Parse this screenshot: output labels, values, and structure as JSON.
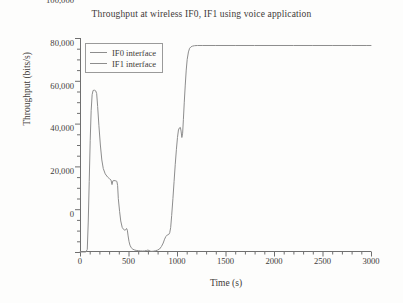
{
  "chart_data": {
    "type": "line",
    "title": "Throughput at wireless IF0, IF1 using voice application",
    "xlabel": "Time (s)",
    "ylabel": "Throughput (bits/s)",
    "xlim": [
      0,
      3000
    ],
    "ylim": [
      0,
      100000
    ],
    "grid": false,
    "legend_position": "upper left",
    "xticks": [
      0,
      500,
      1000,
      1500,
      2000,
      2500,
      3000
    ],
    "xtick_labels": [
      "0",
      "500",
      "1000",
      "1500",
      "2000",
      "2500",
      "3000"
    ],
    "xminor_interval": 100,
    "yticks": [
      0,
      20000,
      40000,
      60000,
      80000,
      100000
    ],
    "ytick_labels": [
      "0",
      "20,000",
      "40,000",
      "60,000",
      "80,000",
      "100,000"
    ],
    "yminor_interval": 5000,
    "line_color": "#8d8d8d",
    "series": [
      {
        "name": "IF0 interface",
        "points": [
          [
            0,
            0
          ],
          [
            40,
            0
          ],
          [
            60,
            0
          ],
          [
            75,
            1200
          ],
          [
            85,
            14000
          ],
          [
            95,
            33000
          ],
          [
            105,
            52000
          ],
          [
            115,
            66000
          ],
          [
            125,
            73500
          ],
          [
            135,
            75500
          ],
          [
            150,
            75600
          ],
          [
            162,
            75300
          ],
          [
            172,
            74000
          ],
          [
            182,
            68000
          ],
          [
            195,
            59000
          ],
          [
            210,
            50000
          ],
          [
            225,
            43000
          ],
          [
            240,
            39000
          ],
          [
            260,
            36500
          ],
          [
            285,
            35000
          ],
          [
            305,
            34200
          ],
          [
            320,
            33600
          ],
          [
            330,
            31500
          ],
          [
            338,
            33200
          ],
          [
            350,
            33400
          ],
          [
            362,
            33300
          ],
          [
            372,
            33200
          ],
          [
            380,
            33000
          ],
          [
            388,
            31000
          ],
          [
            395,
            25000
          ],
          [
            408,
            19000
          ],
          [
            420,
            14500
          ],
          [
            435,
            11500
          ],
          [
            450,
            10500
          ],
          [
            462,
            10200
          ],
          [
            472,
            10400
          ],
          [
            480,
            11000
          ],
          [
            488,
            10200
          ],
          [
            496,
            7500
          ],
          [
            505,
            5000
          ],
          [
            515,
            3200
          ],
          [
            528,
            2000
          ],
          [
            545,
            1300
          ],
          [
            565,
            900
          ],
          [
            585,
            700
          ],
          [
            605,
            600
          ],
          [
            625,
            500
          ],
          [
            645,
            450
          ],
          [
            665,
            500
          ],
          [
            685,
            700
          ],
          [
            700,
            900
          ],
          [
            712,
            700
          ],
          [
            725,
            400
          ],
          [
            740,
            300
          ],
          [
            760,
            400
          ],
          [
            780,
            600
          ],
          [
            800,
            900
          ],
          [
            820,
            1400
          ],
          [
            840,
            2600
          ],
          [
            858,
            4200
          ],
          [
            872,
            6000
          ],
          [
            885,
            7200
          ],
          [
            895,
            7800
          ],
          [
            905,
            8000
          ],
          [
            915,
            8200
          ],
          [
            925,
            9000
          ],
          [
            935,
            11500
          ],
          [
            945,
            17000
          ],
          [
            958,
            25000
          ],
          [
            970,
            33000
          ],
          [
            982,
            41000
          ],
          [
            994,
            48000
          ],
          [
            1005,
            53500
          ],
          [
            1015,
            57000
          ],
          [
            1025,
            58000
          ],
          [
            1035,
            58200
          ],
          [
            1042,
            56500
          ],
          [
            1050,
            53500
          ],
          [
            1058,
            55500
          ],
          [
            1066,
            62000
          ],
          [
            1075,
            70000
          ],
          [
            1085,
            78000
          ],
          [
            1095,
            85000
          ],
          [
            1105,
            90000
          ],
          [
            1118,
            93500
          ],
          [
            1130,
            95200
          ],
          [
            1145,
            95900
          ],
          [
            1160,
            96200
          ],
          [
            1180,
            96400
          ],
          [
            1210,
            96500
          ],
          [
            1260,
            96500
          ],
          [
            1400,
            96500
          ],
          [
            1600,
            96500
          ],
          [
            1800,
            96500
          ],
          [
            2000,
            96500
          ],
          [
            2200,
            96500
          ],
          [
            2400,
            96500
          ],
          [
            2600,
            96500
          ],
          [
            2800,
            96500
          ],
          [
            2950,
            96500
          ],
          [
            3000,
            96500
          ]
        ]
      }
    ],
    "legend_entries": [
      {
        "label": "IF0 interface",
        "color": "#8d8d8d"
      },
      {
        "label": "IF1 interface",
        "color": "#8d8d8d"
      }
    ]
  }
}
